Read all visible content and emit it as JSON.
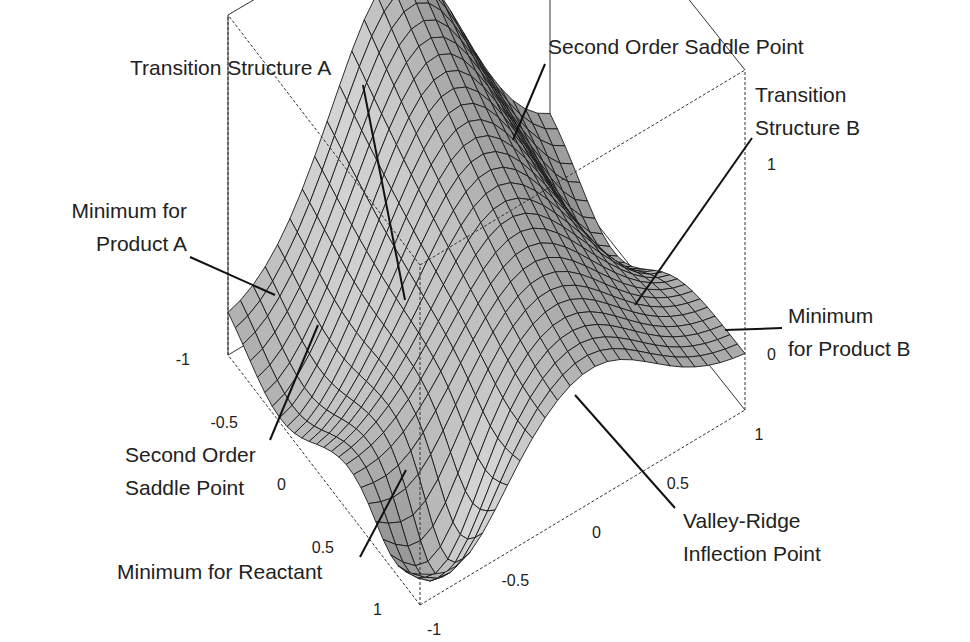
{
  "chart_data": {
    "type": "surface3d",
    "title": "",
    "axes": {
      "x": {
        "range": [
          -1,
          1
        ],
        "ticks": [
          "-1",
          "-0.5",
          "0",
          "0.5",
          "1"
        ]
      },
      "y": {
        "range": [
          -1,
          1
        ],
        "ticks": [
          "-1",
          "-0.5",
          "0",
          "0.5",
          "1"
        ]
      },
      "z": {
        "ticks": [
          "0",
          "1"
        ]
      }
    },
    "grid": true,
    "colors": {
      "surface": "#a8a8a8",
      "mesh": "#1a1a1a",
      "box": "#333333",
      "text": "#222222"
    },
    "annotations": [
      {
        "id": "ts-a",
        "lines": [
          "Transition Structure A"
        ]
      },
      {
        "id": "sosp-top",
        "lines": [
          "Second Order Saddle Point"
        ]
      },
      {
        "id": "ts-b",
        "lines": [
          "Transition",
          "Structure B"
        ]
      },
      {
        "id": "min-prod-a",
        "lines": [
          "Minimum for",
          "Product A"
        ]
      },
      {
        "id": "min-prod-b",
        "lines": [
          "Minimum",
          "for Product B"
        ]
      },
      {
        "id": "sosp-left",
        "lines": [
          "Second Order",
          "Saddle Point"
        ]
      },
      {
        "id": "min-react",
        "lines": [
          "Minimum for Reactant"
        ]
      },
      {
        "id": "vri",
        "lines": [
          "Valley-Ridge",
          "Inflection Point"
        ]
      }
    ]
  }
}
